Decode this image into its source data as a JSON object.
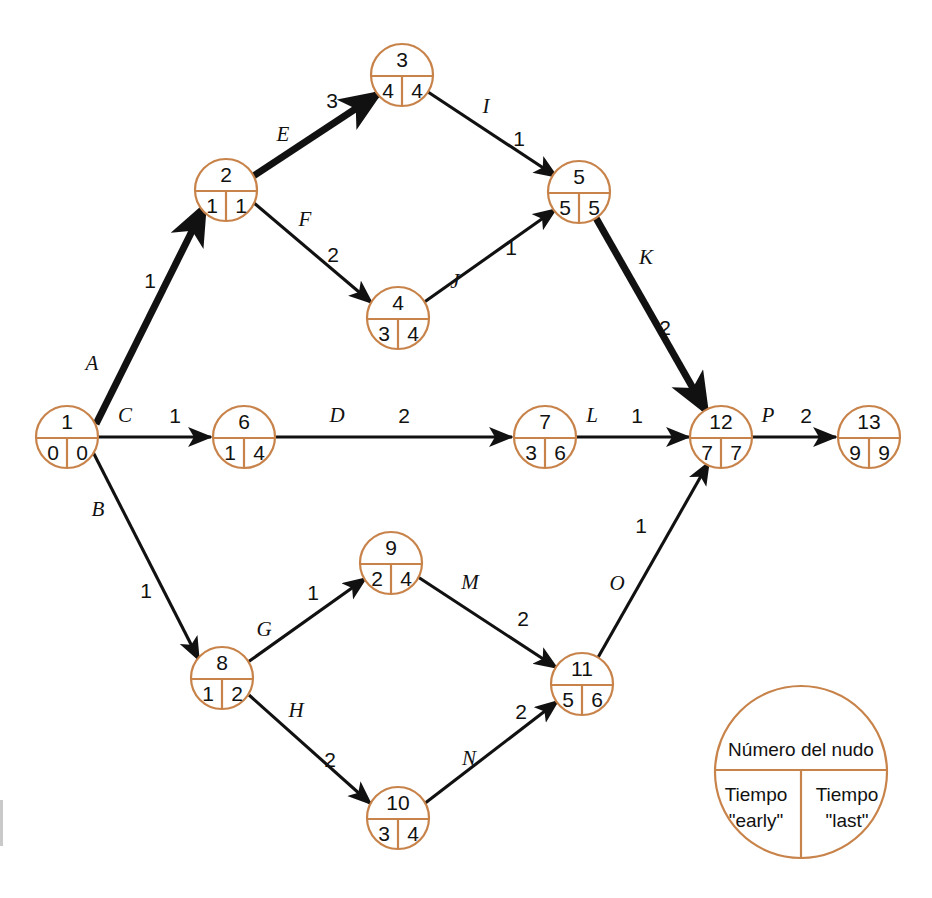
{
  "diagram": {
    "colors": {
      "node_stroke": "#c8834a",
      "edge_normal": "#111111",
      "edge_critical": "#111111",
      "text": "#111111",
      "background": "#ffffff"
    },
    "nodes": [
      {
        "id": "n1",
        "label": "1",
        "early": "0",
        "last": "0",
        "cx": 67,
        "cy": 437,
        "r": 31
      },
      {
        "id": "n2",
        "label": "2",
        "early": "1",
        "last": "1",
        "cx": 226,
        "cy": 190,
        "r": 31
      },
      {
        "id": "n3",
        "label": "3",
        "early": "4",
        "last": "4",
        "cx": 402,
        "cy": 75,
        "r": 31
      },
      {
        "id": "n4",
        "label": "4",
        "early": "3",
        "last": "4",
        "cx": 398,
        "cy": 318,
        "r": 31
      },
      {
        "id": "n5",
        "label": "5",
        "early": "5",
        "last": "5",
        "cx": 579,
        "cy": 192,
        "r": 31
      },
      {
        "id": "n6",
        "label": "6",
        "early": "1",
        "last": "4",
        "cx": 244,
        "cy": 437,
        "r": 31
      },
      {
        "id": "n7",
        "label": "7",
        "early": "3",
        "last": "6",
        "cx": 545,
        "cy": 437,
        "r": 31
      },
      {
        "id": "n8",
        "label": "8",
        "early": "1",
        "last": "2",
        "cx": 222,
        "cy": 678,
        "r": 31
      },
      {
        "id": "n9",
        "label": "9",
        "early": "2",
        "last": "4",
        "cx": 391,
        "cy": 563,
        "r": 31
      },
      {
        "id": "n10",
        "label": "10",
        "early": "3",
        "last": "4",
        "cx": 398,
        "cy": 818,
        "r": 31
      },
      {
        "id": "n11",
        "label": "11",
        "early": "5",
        "last": "6",
        "cx": 582,
        "cy": 684,
        "r": 31
      },
      {
        "id": "n12",
        "label": "12",
        "early": "7",
        "last": "7",
        "cx": 721,
        "cy": 437,
        "r": 31
      },
      {
        "id": "n13",
        "label": "13",
        "early": "9",
        "last": "9",
        "cx": 869,
        "cy": 437,
        "r": 31
      }
    ],
    "edges": [
      {
        "id": "A",
        "letter": "A",
        "duration": "1",
        "from": "n1",
        "to": "n2",
        "critical": true,
        "x1": 96,
        "y1": 424,
        "x2": 204,
        "y2": 207,
        "lx": 92,
        "ly": 365,
        "dx": 150,
        "dy": 282
      },
      {
        "id": "B",
        "letter": "B",
        "duration": "1",
        "from": "n1",
        "to": "n8",
        "critical": false,
        "x1": 93,
        "y1": 452,
        "x2": 199,
        "y2": 660,
        "lx": 98,
        "ly": 511,
        "dx": 146,
        "dy": 592
      },
      {
        "id": "C",
        "letter": "C",
        "duration": "1",
        "from": "n1",
        "to": "n6",
        "critical": false,
        "x1": 96,
        "y1": 437,
        "x2": 211,
        "y2": 437,
        "lx": 125,
        "ly": 417,
        "dx": 175,
        "dy": 417
      },
      {
        "id": "D",
        "letter": "D",
        "duration": "2",
        "from": "n6",
        "to": "n7",
        "critical": false,
        "x1": 276,
        "y1": 437,
        "x2": 512,
        "y2": 437,
        "lx": 337,
        "ly": 417,
        "dx": 404,
        "dy": 417
      },
      {
        "id": "E",
        "letter": "E",
        "duration": "3",
        "from": "n2",
        "to": "n3",
        "critical": true,
        "x1": 252,
        "y1": 177,
        "x2": 378,
        "y2": 94,
        "lx": 283,
        "ly": 136,
        "dx": 332,
        "dy": 102
      },
      {
        "id": "F",
        "letter": "F",
        "duration": "2",
        "from": "n2",
        "to": "n4",
        "critical": false,
        "x1": 254,
        "y1": 203,
        "x2": 372,
        "y2": 303,
        "lx": 305,
        "ly": 221,
        "dx": 333,
        "dy": 256
      },
      {
        "id": "I",
        "letter": "I",
        "duration": "1",
        "from": "n3",
        "to": "n5",
        "critical": false,
        "x1": 428,
        "y1": 92,
        "x2": 557,
        "y2": 177,
        "lx": 486,
        "ly": 108,
        "dx": 519,
        "dy": 140
      },
      {
        "id": "J",
        "letter": "J",
        "duration": "1",
        "from": "n4",
        "to": "n5",
        "critical": false,
        "x1": 423,
        "y1": 303,
        "x2": 556,
        "y2": 209,
        "lx": 455,
        "ly": 283,
        "dx": 511,
        "dy": 249
      },
      {
        "id": "K",
        "letter": "K",
        "duration": "2",
        "from": "n5",
        "to": "n12",
        "critical": true,
        "x1": 596,
        "y1": 218,
        "x2": 706,
        "y2": 411,
        "lx": 646,
        "ly": 259,
        "dx": 665,
        "dy": 329
      },
      {
        "id": "L",
        "letter": "L",
        "duration": "1",
        "from": "n7",
        "to": "n12",
        "critical": false,
        "x1": 577,
        "y1": 437,
        "x2": 689,
        "y2": 437,
        "lx": 592,
        "ly": 417,
        "dx": 637,
        "dy": 417
      },
      {
        "id": "G",
        "letter": "G",
        "duration": "1",
        "from": "n8",
        "to": "n9",
        "critical": false,
        "x1": 248,
        "y1": 662,
        "x2": 366,
        "y2": 578,
        "lx": 264,
        "ly": 631,
        "dx": 313,
        "dy": 594
      },
      {
        "id": "H",
        "letter": "H",
        "duration": "2",
        "from": "n8",
        "to": "n10",
        "critical": false,
        "x1": 249,
        "y1": 695,
        "x2": 371,
        "y2": 804,
        "lx": 296,
        "ly": 712,
        "dx": 330,
        "dy": 761
      },
      {
        "id": "M",
        "letter": "M",
        "duration": "2",
        "from": "n9",
        "to": "n11",
        "critical": false,
        "x1": 418,
        "y1": 577,
        "x2": 557,
        "y2": 668,
        "lx": 470,
        "ly": 584,
        "dx": 523,
        "dy": 620
      },
      {
        "id": "N",
        "letter": "N",
        "duration": "2",
        "from": "n10",
        "to": "n11",
        "critical": false,
        "x1": 424,
        "y1": 804,
        "x2": 558,
        "y2": 701,
        "lx": 469,
        "ly": 760,
        "dx": 521,
        "dy": 713
      },
      {
        "id": "O",
        "letter": "O",
        "duration": "1",
        "from": "n11",
        "to": "n12",
        "critical": false,
        "x1": 596,
        "y1": 661,
        "x2": 709,
        "y2": 462,
        "lx": 617,
        "ly": 585,
        "dx": 641,
        "dy": 527
      },
      {
        "id": "P",
        "letter": "P",
        "duration": "2",
        "from": "n12",
        "to": "n13",
        "critical": false,
        "x1": 753,
        "y1": 437,
        "x2": 836,
        "y2": 437,
        "lx": 768,
        "ly": 417,
        "dx": 806,
        "dy": 417
      }
    ],
    "legend": {
      "cx": 801,
      "cy": 772,
      "r": 86,
      "node_number_label": "Número del nudo",
      "early_line1": "Tiempo",
      "early_line2": "\"early\"",
      "last_line1": "Tiempo",
      "last_line2": "\"last\""
    }
  }
}
